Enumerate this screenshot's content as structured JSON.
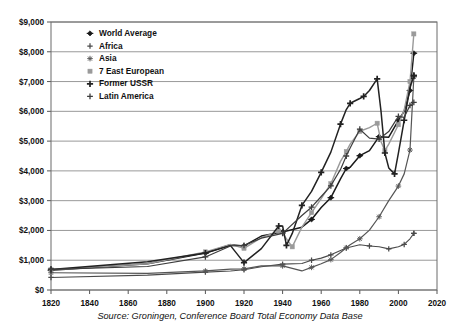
{
  "chart_data": {
    "type": "line",
    "title": "",
    "subtitle": "",
    "xlabel": "",
    "ylabel": "",
    "xlim": [
      1820,
      2020
    ],
    "ylim": [
      0,
      9000
    ],
    "grid": true,
    "legend_position": "top-left",
    "source_note": "Source: Groningen, Conference Board Total Economy Data Base",
    "y_ticks": [
      "$0",
      "$1,000",
      "$2,000",
      "$3,000",
      "$4,000",
      "$5,000",
      "$6,000",
      "$7,000",
      "$8,000",
      "$9,000"
    ],
    "y_tick_values": [
      0,
      1000,
      2000,
      3000,
      4000,
      5000,
      6000,
      7000,
      8000,
      9000
    ],
    "x_ticks": [
      "1820",
      "1840",
      "1860",
      "1880",
      "1900",
      "1920",
      "1940",
      "1960",
      "1980",
      "2000",
      "2020"
    ],
    "x_tick_values": [
      1820,
      1840,
      1860,
      1880,
      1900,
      1920,
      1940,
      1960,
      1980,
      2000,
      2020
    ],
    "series": [
      {
        "name": "World Average",
        "marker": "diamond",
        "color": "#1a1a1a",
        "width": 1.5,
        "x": [
          1820,
          1870,
          1900,
          1913,
          1920,
          1929,
          1940,
          1950,
          1955,
          1960,
          1965,
          1970,
          1973,
          1975,
          1980,
          1985,
          1990,
          1995,
          2000,
          2003,
          2006,
          2008
        ],
        "y": [
          660,
          880,
          1240,
          1520,
          1480,
          1810,
          1950,
          2110,
          2370,
          2770,
          3100,
          3730,
          4080,
          4120,
          4510,
          4680,
          5150,
          5130,
          5700,
          6000,
          6700,
          7950
        ]
      },
      {
        "name": "Africa",
        "marker": "cross",
        "color": "#4a4a4a",
        "width": 1.1,
        "x": [
          1820,
          1870,
          1900,
          1913,
          1920,
          1929,
          1940,
          1950,
          1955,
          1960,
          1965,
          1970,
          1973,
          1980,
          1985,
          1990,
          1995,
          2000,
          2003,
          2006,
          2008
        ],
        "y": [
          420,
          500,
          600,
          640,
          680,
          780,
          870,
          890,
          1000,
          1070,
          1180,
          1330,
          1410,
          1520,
          1480,
          1450,
          1380,
          1450,
          1530,
          1720,
          1900
        ]
      },
      {
        "name": "Asia",
        "marker": "star",
        "color": "#555555",
        "width": 1.2,
        "x": [
          1820,
          1870,
          1900,
          1913,
          1920,
          1929,
          1940,
          1950,
          1955,
          1960,
          1965,
          1970,
          1973,
          1975,
          1980,
          1985,
          1990,
          1995,
          2000,
          2003,
          2006,
          2008
        ],
        "y": [
          580,
          560,
          640,
          700,
          710,
          810,
          810,
          640,
          760,
          880,
          1020,
          1260,
          1420,
          1520,
          1720,
          2010,
          2460,
          3000,
          3490,
          3900,
          4700,
          7150
        ]
      },
      {
        "name": "7 East European",
        "marker": "square-lt",
        "color": "#9a9a9a",
        "width": 1.4,
        "x": [
          1820,
          1870,
          1900,
          1913,
          1920,
          1929,
          1938,
          1940,
          1945,
          1950,
          1955,
          1960,
          1965,
          1970,
          1973,
          1975,
          1980,
          1985,
          1989,
          1991,
          1993,
          1995,
          2000,
          2003,
          2006,
          2008
        ],
        "y": [
          680,
          880,
          1280,
          1530,
          1400,
          1760,
          1980,
          1900,
          1450,
          2110,
          2600,
          3070,
          3570,
          4320,
          4650,
          4900,
          5330,
          5450,
          5600,
          4980,
          4680,
          4900,
          5550,
          6050,
          7000,
          8600
        ]
      },
      {
        "name": "Former USSR",
        "marker": "plus-bold",
        "color": "#222222",
        "width": 1.5,
        "x": [
          1820,
          1870,
          1900,
          1913,
          1920,
          1929,
          1938,
          1940,
          1942,
          1945,
          1950,
          1955,
          1960,
          1965,
          1970,
          1973,
          1975,
          1980,
          1982,
          1985,
          1989,
          1991,
          1993,
          1995,
          1998,
          2000,
          2003,
          2006,
          2008
        ],
        "y": [
          690,
          950,
          1240,
          1490,
          920,
          1390,
          2150,
          2150,
          1500,
          1900,
          2840,
          3310,
          3950,
          4630,
          5570,
          6060,
          6270,
          6430,
          6500,
          6700,
          7090,
          6000,
          4600,
          4100,
          3900,
          4600,
          5700,
          6800,
          7200
        ]
      },
      {
        "name": "Latin America",
        "marker": "plus",
        "color": "#3d3d3d",
        "width": 1.2,
        "x": [
          1820,
          1870,
          1900,
          1913,
          1920,
          1929,
          1940,
          1950,
          1955,
          1960,
          1965,
          1970,
          1973,
          1975,
          1980,
          1985,
          1990,
          1995,
          2000,
          2003,
          2006,
          2008
        ],
        "y": [
          690,
          790,
          1110,
          1480,
          1500,
          1740,
          1900,
          2500,
          2780,
          3140,
          3500,
          4050,
          4500,
          4770,
          5400,
          5100,
          5070,
          5320,
          5830,
          5800,
          6200,
          6300
        ]
      }
    ]
  },
  "legend": {
    "items": [
      {
        "label": "World Average"
      },
      {
        "label": "Africa"
      },
      {
        "label": "Asia"
      },
      {
        "label": "7 East European"
      },
      {
        "label": "Former USSR"
      },
      {
        "label": "Latin America"
      }
    ]
  },
  "colors": {
    "axis": "#555555",
    "grid": "#8d8d8d",
    "border": "#6b6b6b",
    "background": "#ffffff",
    "text": "#111111"
  }
}
